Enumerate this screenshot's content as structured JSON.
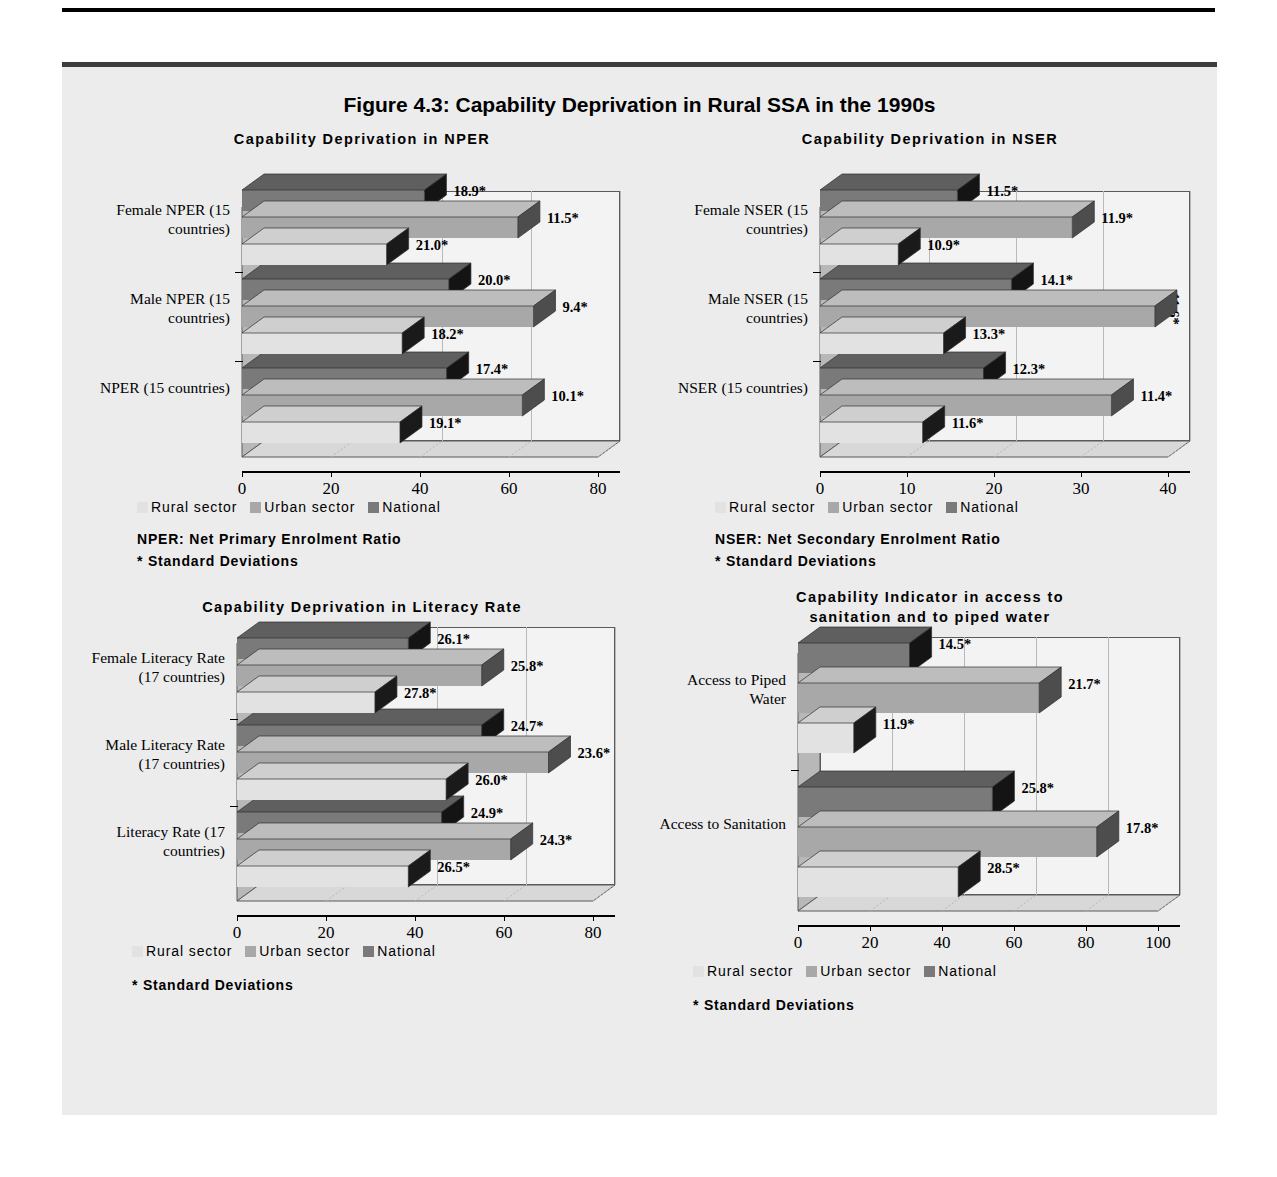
{
  "figure": {
    "title": "Figure 4.3: Capability Deprivation in Rural SSA in the 1990s"
  },
  "colors": {
    "rural": "#e2e2e2",
    "rural_side": "#1a1a1a",
    "rural_top": "#cfcfcf",
    "urban": "#a8a8a8",
    "urban_side": "#4d4d4d",
    "urban_top": "#bdbdbd",
    "national": "#7a7a7a",
    "national_side": "#141414",
    "national_top": "#5f5f5f",
    "panel_bg": "#ececed",
    "plot_bg": "#f3f3f3",
    "grid": "#b9b9b9",
    "axis": "#000000"
  },
  "legend": {
    "items": [
      {
        "label": "Rural sector",
        "key": "rural"
      },
      {
        "label": "Urban sector",
        "key": "urban"
      },
      {
        "label": "National",
        "key": "national"
      }
    ]
  },
  "panels": {
    "nper": {
      "title": "Capability Deprivation in NPER",
      "notes": [
        "NPER: Net Primary Enrolment Ratio",
        "*     Standard Deviations"
      ]
    },
    "nser": {
      "title": "Capability Deprivation in NSER",
      "notes": [
        "NSER: Net Secondary Enrolment Ratio",
        "*     Standard Deviations"
      ]
    },
    "literacy": {
      "title": "Capability Deprivation in Literacy Rate",
      "notes": [
        "*     Standard Deviations"
      ]
    },
    "sanitation": {
      "title_line1": "Capability Indicator in access to",
      "title_line2": "sanitation and to piped water",
      "notes": [
        "*     Standard Deviations"
      ]
    }
  },
  "chart_data": [
    {
      "id": "nper",
      "type": "bar",
      "orientation": "horizontal",
      "title": "Capability Deprivation in NPER",
      "xlabel": "",
      "ylabel": "",
      "xlim": [
        0,
        80
      ],
      "xticks": [
        0,
        20,
        40,
        60,
        80
      ],
      "grid": true,
      "legend_position": "below",
      "categories": [
        "NPER (15 countries)",
        "Male NPER (15 countries)",
        "Female NPER (15 countries)"
      ],
      "series": [
        {
          "name": "Rural sector",
          "values": [
            35.5,
            36.0,
            32.5
          ],
          "labels": [
            "19.1*",
            "18.2*",
            "21.0*"
          ]
        },
        {
          "name": "Urban sector",
          "values": [
            63.0,
            65.5,
            62.0
          ],
          "labels": [
            "10.1*",
            "9.4*",
            "11.5*"
          ]
        },
        {
          "name": "National",
          "values": [
            46.0,
            46.5,
            41.0
          ],
          "labels": [
            "17.4*",
            "20.0*",
            "18.9*"
          ]
        }
      ]
    },
    {
      "id": "nser",
      "type": "bar",
      "orientation": "horizontal",
      "title": "Capability Deprivation in NSER",
      "xlabel": "",
      "ylabel": "",
      "xlim": [
        0,
        40
      ],
      "xticks": [
        0,
        10,
        20,
        30,
        40
      ],
      "grid": true,
      "legend_position": "below",
      "categories": [
        "NSER (15 countries)",
        "Male NSER (15 countries)",
        "Female NSER (15 countries)"
      ],
      "series": [
        {
          "name": "Rural sector",
          "values": [
            11.8,
            14.2,
            9.0
          ],
          "labels": [
            "11.6*",
            "13.3*",
            "10.9*"
          ]
        },
        {
          "name": "Urban sector",
          "values": [
            33.5,
            38.5,
            29.0
          ],
          "labels": [
            "11.4*",
            "11.6*",
            "11.9*"
          ]
        },
        {
          "name": "National",
          "values": [
            18.8,
            22.0,
            15.8
          ],
          "labels": [
            "12.3*",
            "14.1*",
            "11.5*"
          ]
        }
      ]
    },
    {
      "id": "literacy",
      "type": "bar",
      "orientation": "horizontal",
      "title": "Capability Deprivation in Literacy Rate",
      "xlabel": "",
      "ylabel": "",
      "xlim": [
        0,
        80
      ],
      "xticks": [
        0,
        20,
        40,
        60,
        80
      ],
      "grid": true,
      "legend_position": "below",
      "categories": [
        "Literacy Rate (17 countries)",
        "Male Literacy Rate (17 countries)",
        "Female Literacy Rate (17 countries)"
      ],
      "series": [
        {
          "name": "Rural sector",
          "values": [
            38.5,
            47.0,
            31.0
          ],
          "labels": [
            "26.5*",
            "26.0*",
            "27.8*"
          ]
        },
        {
          "name": "Urban sector",
          "values": [
            61.5,
            70.0,
            55.0
          ],
          "labels": [
            "24.3*",
            "23.6*",
            "25.8*"
          ]
        },
        {
          "name": "National",
          "values": [
            46.0,
            55.0,
            38.5
          ],
          "labels": [
            "24.9*",
            "24.7*",
            "26.1*"
          ]
        }
      ]
    },
    {
      "id": "sanitation",
      "type": "bar",
      "orientation": "horizontal",
      "title": "Capability Indicator in access to sanitation and to piped water",
      "xlabel": "",
      "ylabel": "",
      "xlim": [
        0,
        100
      ],
      "xticks": [
        0,
        20,
        40,
        60,
        80,
        100
      ],
      "grid": true,
      "legend_position": "below",
      "categories": [
        "Access to Sanitation",
        "Access to Piped Water"
      ],
      "series": [
        {
          "name": "Rural sector",
          "values": [
            44.5,
            15.5
          ],
          "labels": [
            "28.5*",
            "11.9*"
          ]
        },
        {
          "name": "Urban sector",
          "values": [
            83.0,
            67.0
          ],
          "labels": [
            "17.8*",
            "21.7*"
          ]
        },
        {
          "name": "National",
          "values": [
            54.0,
            31.0
          ],
          "labels": [
            "25.8*",
            "14.5*"
          ]
        }
      ]
    }
  ]
}
